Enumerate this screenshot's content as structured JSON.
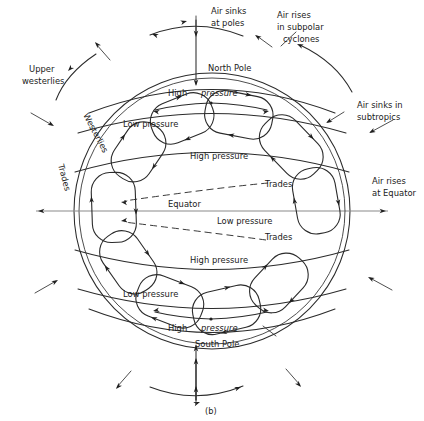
{
  "figure": {
    "caption": "(b)",
    "title_hidden": "Global atmospheric circulation cells"
  },
  "colors": {
    "ink": "#2b2b2b",
    "dashed": "#3a3a3a",
    "equator": "#8a8a8a",
    "background": "#ffffff"
  },
  "annotations": {
    "air_sinks_poles": [
      "Air sinks",
      "at poles"
    ],
    "air_rises_subpolar": [
      "Air rises",
      "in subpolar",
      "cyclones"
    ],
    "air_sinks_subtropics": [
      "Air sinks in",
      "subtropics"
    ],
    "air_rises_equator": [
      "Air rises",
      "at Equator"
    ],
    "upper_westerlies": [
      "Upper",
      "westerlies"
    ]
  },
  "cell_labels": {
    "westerlies": "Westerlies",
    "trades": "Trades"
  },
  "globe_labels": {
    "north_pole": "North Pole",
    "south_pole": "South Pole",
    "equator": "Equator",
    "high": "High",
    "pressure_italic": "pressure",
    "high_pressure": "High pressure",
    "low_pressure": "Low pressure",
    "trades": "Trades"
  },
  "bands": [
    {
      "name": "north-polar-high",
      "label": "High pressure",
      "italic_split": true
    },
    {
      "name": "north-subpolar-low",
      "label": "Low pressure",
      "italic_split": false
    },
    {
      "name": "north-subtropical-high",
      "label": "High pressure",
      "italic_split": false
    },
    {
      "name": "equatorial-low",
      "label": "Low pressure",
      "italic_split": false
    },
    {
      "name": "south-subtropical-high",
      "label": "High pressure",
      "italic_split": false
    },
    {
      "name": "south-subpolar-low",
      "label": "Low pressure",
      "italic_split": false
    },
    {
      "name": "south-polar-high",
      "label": "High pressure",
      "italic_split": true
    }
  ]
}
